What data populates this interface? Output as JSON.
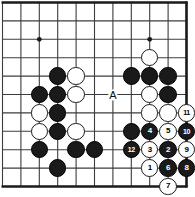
{
  "figure": {
    "name": "go-board-diagram",
    "width": 195,
    "height": 197,
    "background": "#ffffff",
    "line_color": "#3c3c3c",
    "edge_color": "#1a1a1a",
    "black_color": "#1a1a1a",
    "white_color": "#ffffff"
  },
  "board": {
    "origin_x": 2.5,
    "origin_y": 2.5,
    "spacing": 18.4,
    "cols": 11,
    "rows": 11,
    "thick_edges": [
      "top",
      "right",
      "bottom"
    ],
    "star_points": [
      {
        "col": 2,
        "row": 2
      },
      {
        "col": 2,
        "row": 7
      },
      {
        "col": 8,
        "row": 2
      }
    ]
  },
  "markers": [
    {
      "label": "A",
      "col": 6,
      "row": 5,
      "name": "point-marker-a"
    }
  ],
  "stones": [
    {
      "color": "white",
      "col": 8,
      "row": 3,
      "label": "",
      "name": "white-stone"
    },
    {
      "color": "black",
      "col": 3,
      "row": 4,
      "label": "",
      "name": "black-stone"
    },
    {
      "color": "white",
      "col": 4,
      "row": 4,
      "label": "",
      "name": "white-stone"
    },
    {
      "color": "black",
      "col": 7,
      "row": 4,
      "label": "",
      "name": "black-stone"
    },
    {
      "color": "black",
      "col": 8,
      "row": 4,
      "label": "",
      "name": "black-stone"
    },
    {
      "color": "black",
      "col": 9,
      "row": 4,
      "label": "",
      "name": "black-stone"
    },
    {
      "color": "black",
      "col": 2,
      "row": 5,
      "label": "",
      "name": "black-stone"
    },
    {
      "color": "black",
      "col": 3,
      "row": 5,
      "label": "",
      "name": "black-stone"
    },
    {
      "color": "white",
      "col": 4,
      "row": 5,
      "label": "",
      "name": "white-stone"
    },
    {
      "color": "white",
      "col": 8,
      "row": 5,
      "label": "",
      "name": "white-stone"
    },
    {
      "color": "black",
      "col": 9,
      "row": 5,
      "label": "",
      "name": "black-stone"
    },
    {
      "color": "white",
      "col": 2,
      "row": 6,
      "label": "",
      "name": "white-stone"
    },
    {
      "color": "black",
      "col": 3,
      "row": 6,
      "label": "",
      "name": "black-stone"
    },
    {
      "color": "white",
      "col": 8,
      "row": 6,
      "label": "",
      "name": "white-stone"
    },
    {
      "color": "white",
      "col": 9,
      "row": 6,
      "label": "",
      "name": "white-stone"
    },
    {
      "color": "white",
      "col": 10,
      "row": 6,
      "label": "11",
      "name": "white-stone-11"
    },
    {
      "color": "white",
      "col": 2,
      "row": 7,
      "label": "",
      "name": "white-stone"
    },
    {
      "color": "black",
      "col": 3,
      "row": 7,
      "label": "",
      "name": "black-stone"
    },
    {
      "color": "white",
      "col": 4,
      "row": 7,
      "label": "",
      "name": "white-stone"
    },
    {
      "color": "black",
      "col": 7,
      "row": 7,
      "label": "",
      "name": "black-stone"
    },
    {
      "color": "black",
      "col": 8,
      "row": 7,
      "label": "4",
      "name": "black-stone-4"
    },
    {
      "color": "white",
      "col": 9,
      "row": 7,
      "label": "5",
      "name": "white-stone-5"
    },
    {
      "color": "black",
      "col": 10,
      "row": 7,
      "label": "10",
      "name": "black-stone-10"
    },
    {
      "color": "black",
      "col": 2,
      "row": 8,
      "label": "",
      "name": "black-stone"
    },
    {
      "color": "black",
      "col": 4,
      "row": 8,
      "label": "",
      "name": "black-stone"
    },
    {
      "color": "black",
      "col": 5,
      "row": 8,
      "label": "",
      "name": "black-stone"
    },
    {
      "color": "black",
      "col": 7,
      "row": 8,
      "label": "12",
      "name": "black-stone-12"
    },
    {
      "color": "white",
      "col": 8,
      "row": 8,
      "label": "3",
      "name": "white-stone-3"
    },
    {
      "color": "black",
      "col": 9,
      "row": 8,
      "label": "2",
      "name": "black-stone-2"
    },
    {
      "color": "white",
      "col": 10,
      "row": 8,
      "label": "9",
      "name": "white-stone-9"
    },
    {
      "color": "black",
      "col": 3,
      "row": 9,
      "label": "",
      "name": "black-stone"
    },
    {
      "color": "white",
      "col": 8,
      "row": 9,
      "label": "1",
      "name": "white-stone-1"
    },
    {
      "color": "black",
      "col": 9,
      "row": 9,
      "label": "6",
      "name": "black-stone-6"
    },
    {
      "color": "black",
      "col": 10,
      "row": 9,
      "label": "8",
      "name": "black-stone-8"
    },
    {
      "color": "white",
      "col": 9,
      "row": 10,
      "label": "7",
      "name": "white-stone-7"
    }
  ]
}
